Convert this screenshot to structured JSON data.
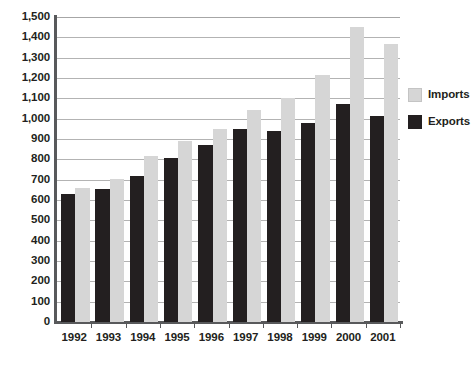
{
  "chart_data": {
    "type": "bar",
    "title": "",
    "subtitle": "",
    "xlabel": "",
    "ylabel": "",
    "categories": [
      "1992",
      "1993",
      "1994",
      "1995",
      "1996",
      "1997",
      "1998",
      "1999",
      "2000",
      "2001"
    ],
    "series": [
      {
        "name": "Exports",
        "color": "#231f20",
        "values": [
          630,
          655,
          720,
          805,
          870,
          950,
          940,
          980,
          1070,
          1015
        ]
      },
      {
        "name": "Imports",
        "color": "#d6d6d6",
        "values": [
          660,
          705,
          815,
          890,
          950,
          1045,
          1100,
          1215,
          1450,
          1365
        ]
      }
    ],
    "series_draw_order": [
      "Exports",
      "Imports"
    ],
    "ylim": [
      0,
      1500
    ],
    "ytick_step": 100,
    "ytick_labels": [
      "0",
      "100",
      "200",
      "300",
      "400",
      "500",
      "600",
      "700",
      "800",
      "900",
      "1,000",
      "1,100",
      "1,200",
      "1,300",
      "1,400",
      "1,500"
    ],
    "ytick_values": [
      0,
      100,
      200,
      300,
      400,
      500,
      600,
      700,
      800,
      900,
      1000,
      1100,
      1200,
      1300,
      1400,
      1500
    ],
    "grid": true,
    "grid_orientation": "horizontal",
    "grid_color": "#b3b3b3",
    "axis_color": "#58595b",
    "background_color": "#ffffff",
    "legend_position": "right",
    "legend": [
      {
        "label": "Imports",
        "swatch": "imports"
      },
      {
        "label": "Exports",
        "swatch": "exports"
      }
    ]
  }
}
